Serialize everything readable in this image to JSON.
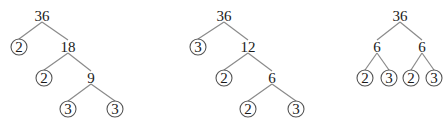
{
  "trees": [
    {
      "id": "tree-1",
      "nodes": [
        {
          "label": "36",
          "x": 42,
          "y": 16,
          "circled": false
        },
        {
          "label": "2",
          "x": 19,
          "y": 47,
          "circled": true
        },
        {
          "label": "18",
          "x": 68,
          "y": 47,
          "circled": false
        },
        {
          "label": "2",
          "x": 44,
          "y": 78,
          "circled": true
        },
        {
          "label": "9",
          "x": 91,
          "y": 78,
          "circled": false
        },
        {
          "label": "3",
          "x": 68,
          "y": 109,
          "circled": true
        },
        {
          "label": "3",
          "x": 115,
          "y": 109,
          "circled": true
        }
      ],
      "edges": [
        [
          0,
          1
        ],
        [
          0,
          2
        ],
        [
          2,
          3
        ],
        [
          2,
          4
        ],
        [
          4,
          5
        ],
        [
          4,
          6
        ]
      ]
    },
    {
      "id": "tree-2",
      "nodes": [
        {
          "label": "36",
          "x": 224,
          "y": 16,
          "circled": false
        },
        {
          "label": "3",
          "x": 198,
          "y": 47,
          "circled": true
        },
        {
          "label": "12",
          "x": 248,
          "y": 47,
          "circled": false
        },
        {
          "label": "2",
          "x": 224,
          "y": 78,
          "circled": true
        },
        {
          "label": "6",
          "x": 272,
          "y": 78,
          "circled": false
        },
        {
          "label": "2",
          "x": 248,
          "y": 109,
          "circled": true
        },
        {
          "label": "3",
          "x": 296,
          "y": 109,
          "circled": true
        }
      ],
      "edges": [
        [
          0,
          1
        ],
        [
          0,
          2
        ],
        [
          2,
          3
        ],
        [
          2,
          4
        ],
        [
          4,
          5
        ],
        [
          4,
          6
        ]
      ]
    },
    {
      "id": "tree-3",
      "nodes": [
        {
          "label": "36",
          "x": 400,
          "y": 16,
          "circled": false
        },
        {
          "label": "6",
          "x": 377,
          "y": 47,
          "circled": false
        },
        {
          "label": "6",
          "x": 422,
          "y": 47,
          "circled": false
        },
        {
          "label": "2",
          "x": 365,
          "y": 78,
          "circled": true
        },
        {
          "label": "3",
          "x": 389,
          "y": 78,
          "circled": true
        },
        {
          "label": "2",
          "x": 411,
          "y": 78,
          "circled": true
        },
        {
          "label": "3",
          "x": 434,
          "y": 78,
          "circled": true
        }
      ],
      "edges": [
        [
          0,
          1
        ],
        [
          0,
          2
        ],
        [
          1,
          3
        ],
        [
          1,
          4
        ],
        [
          2,
          5
        ],
        [
          2,
          6
        ]
      ]
    }
  ],
  "colors": {
    "text": "#1a1a1a",
    "edge": "#8a8a8a",
    "ring": "#555555",
    "background": "#ffffff"
  }
}
